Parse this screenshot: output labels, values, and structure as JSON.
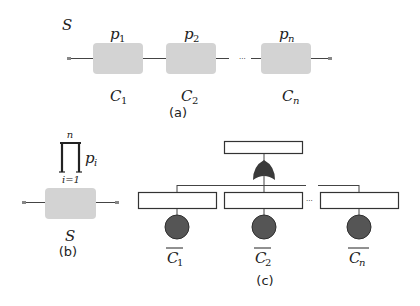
{
  "panel_a": {
    "system_label": "S",
    "components": [
      {
        "prob": "p",
        "prob_sub": "1",
        "name": "C",
        "name_sub": "1"
      },
      {
        "prob": "p",
        "prob_sub": "2",
        "name": "C",
        "name_sub": "2"
      },
      {
        "prob": "p",
        "prob_sub": "n",
        "name": "C",
        "name_sub": "n"
      }
    ],
    "ellipsis": "···",
    "caption": "(a)"
  },
  "panel_b": {
    "product_symbol": "∏",
    "product_upper": "n",
    "product_lower": "i=1",
    "product_term": "p",
    "product_term_sub": "i",
    "system_label": "S",
    "caption": "(b)"
  },
  "panel_c": {
    "events": [
      {
        "name": "C",
        "name_sub": "1"
      },
      {
        "name": "C",
        "name_sub": "2"
      },
      {
        "name": "C",
        "name_sub": "n"
      }
    ],
    "ellipsis": "···",
    "gate_type": "or-gate",
    "caption": "(c)"
  },
  "colors": {
    "component_fill": "#d3d3d3",
    "line": "#444444",
    "event_fill": "#555555",
    "event_stroke": "#2e2e2e",
    "gate_fill": "#3a3a3a"
  }
}
